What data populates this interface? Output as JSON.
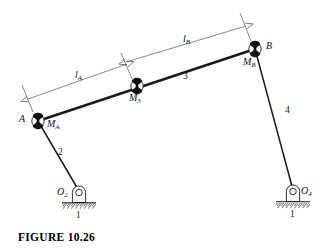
{
  "figure": {
    "caption": "FIGURE  10.26",
    "type": "four-bar linkage kinematic diagram"
  },
  "joints": [
    {
      "id": "A",
      "label": "A",
      "x": 38,
      "y": 121,
      "kind": "pin-joint"
    },
    {
      "id": "M3",
      "label": "M3",
      "x": 137,
      "y": 86,
      "kind": "pin-joint"
    },
    {
      "id": "B",
      "label": "B",
      "x": 255,
      "y": 49,
      "kind": "pin-joint"
    },
    {
      "id": "O2",
      "label": "O2",
      "x": 79,
      "y": 193,
      "kind": "ground-pivot"
    },
    {
      "id": "O4",
      "label": "O4",
      "x": 293,
      "y": 192,
      "kind": "ground-pivot"
    }
  ],
  "point_labels": {
    "A": "A",
    "B": "B",
    "M_A": "M",
    "M_A_sub": "A",
    "M_3": "M",
    "M_3_sub": "3",
    "M_B": "M",
    "M_B_sub": "B",
    "O_2": "O",
    "O_2_sub": "2",
    "O_4": "O",
    "O_4_sub": "4"
  },
  "link_labels": [
    {
      "name": "crank",
      "text": "2",
      "x": 60,
      "y": 154
    },
    {
      "name": "coupler",
      "text": "3",
      "x": 186,
      "y": 79
    },
    {
      "name": "rocker",
      "text": "4",
      "x": 288,
      "y": 112
    },
    {
      "name": "ground-left",
      "text": "1",
      "x": 79,
      "y": 215
    },
    {
      "name": "ground-right",
      "text": "1",
      "x": 293,
      "y": 215
    }
  ],
  "dimensions": [
    {
      "name": "l_A",
      "text": "l",
      "sub": "A",
      "from": "A",
      "to": "M3",
      "x": 78,
      "y": 76
    },
    {
      "name": "l_B",
      "text": "l",
      "sub": "B",
      "from": "M3",
      "to": "B",
      "x": 186,
      "y": 40
    }
  ],
  "colors": {
    "ink": "#141414",
    "link_stroke": "#1a1a1a",
    "dimension_stroke": "#555555",
    "hatch": "#333333",
    "joint_fill": "#111111",
    "page_bg": "#ffffff"
  },
  "geometry": {
    "link3_thickness": 2.6,
    "link2_thickness": 1.6,
    "link4_thickness": 1.6,
    "dimension_thickness": 0.7
  }
}
